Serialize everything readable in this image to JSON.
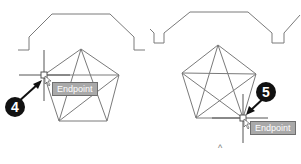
{
  "panels": [
    {
      "id": "left",
      "step": {
        "number": "4"
      },
      "tooltip": {
        "label": "Endpoint"
      }
    },
    {
      "id": "right",
      "step": {
        "number": "5"
      },
      "tooltip": {
        "label": "Endpoint"
      },
      "ucs_marker": "^"
    }
  ],
  "colors": {
    "line": "#7a7a7a",
    "badge": "#111111",
    "tooltip_bg": "#a9a9a9"
  }
}
